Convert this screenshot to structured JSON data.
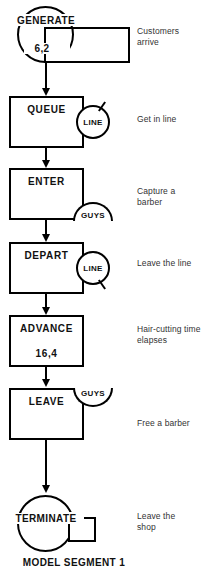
{
  "caption": "MODEL SEGMENT 1",
  "blocks": [
    {
      "id": "generate",
      "shape": "circle-with-tail",
      "label": "GENERATE",
      "operands": "6,2",
      "note": "Customers arrive"
    },
    {
      "id": "queue",
      "shape": "rect",
      "label": "QUEUE",
      "entity": "LINE",
      "entity_shape": "circle",
      "tick": "up-right",
      "note": "Get in line"
    },
    {
      "id": "enter",
      "shape": "rect",
      "label": "ENTER",
      "entity": "GUYS",
      "entity_shape": "half-circle-top",
      "note": "Capture a barber"
    },
    {
      "id": "depart",
      "shape": "rect",
      "label": "DEPART",
      "entity": "LINE",
      "entity_shape": "circle",
      "tick": "down-right",
      "note": "Leave the line"
    },
    {
      "id": "advance",
      "shape": "rect",
      "label": "ADVANCE",
      "operands": "16,4",
      "note": "Hair-cutting time elapses"
    },
    {
      "id": "leave",
      "shape": "rect",
      "label": "LEAVE",
      "entity": "GUYS",
      "entity_shape": "half-circle-bottom",
      "note": "Free a barber"
    },
    {
      "id": "terminate",
      "shape": "circle-with-tail",
      "label": "TERMINATE",
      "note": "Leave the shop"
    }
  ],
  "colors": {
    "stroke": "#000000",
    "text": "#111111",
    "note_text": "#333333",
    "background": "#ffffff"
  }
}
